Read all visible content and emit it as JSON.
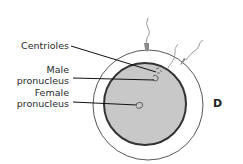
{
  "figure": {
    "panel_letter": "D",
    "labels": {
      "centrioles": "Centrioles",
      "male_line1": "Male",
      "male_line2": "pronucleus",
      "female_line1": "Female",
      "female_line2": "pronucleus"
    },
    "colors": {
      "cytoplasm": "#c8c8c8",
      "membrane": "#333333",
      "zona": "#ffffff",
      "outline": "#444444",
      "sperm": "#8a8a8a"
    }
  }
}
